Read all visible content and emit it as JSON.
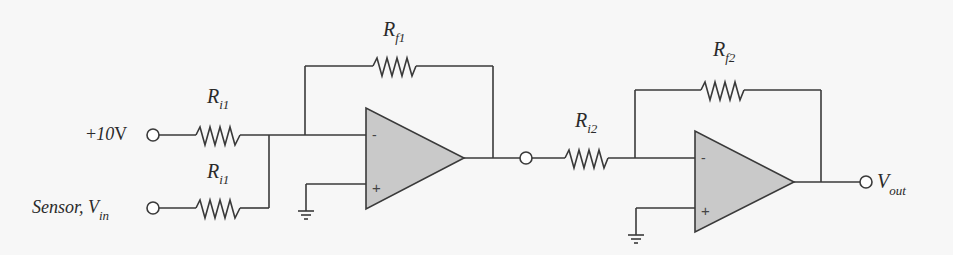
{
  "diagram": {
    "type": "circuit-schematic",
    "inputs": [
      {
        "id": "vref",
        "label_prefix": "+",
        "label_value": "10",
        "label_unit": "V"
      },
      {
        "id": "vin",
        "label_main": "Sensor, V",
        "label_sub": "in"
      }
    ],
    "resistors": [
      {
        "id": "ri1_top",
        "label_main": "R",
        "label_sub": "i1"
      },
      {
        "id": "ri1_bottom",
        "label_main": "R",
        "label_sub": "i1"
      },
      {
        "id": "rf1",
        "label_main": "R",
        "label_sub": "f1"
      },
      {
        "id": "ri2",
        "label_main": "R",
        "label_sub": "i2"
      },
      {
        "id": "rf2",
        "label_main": "R",
        "label_sub": "f2"
      }
    ],
    "opamps": [
      {
        "id": "opamp1",
        "minus": "-",
        "plus": "+"
      },
      {
        "id": "opamp2",
        "minus": "-",
        "plus": "+"
      }
    ],
    "output": {
      "label_main": "V",
      "label_sub": "out"
    },
    "colors": {
      "wire": "#3a3a3a",
      "opamp_fill": "#c9c9c9",
      "background": "#f7f7f7"
    }
  }
}
